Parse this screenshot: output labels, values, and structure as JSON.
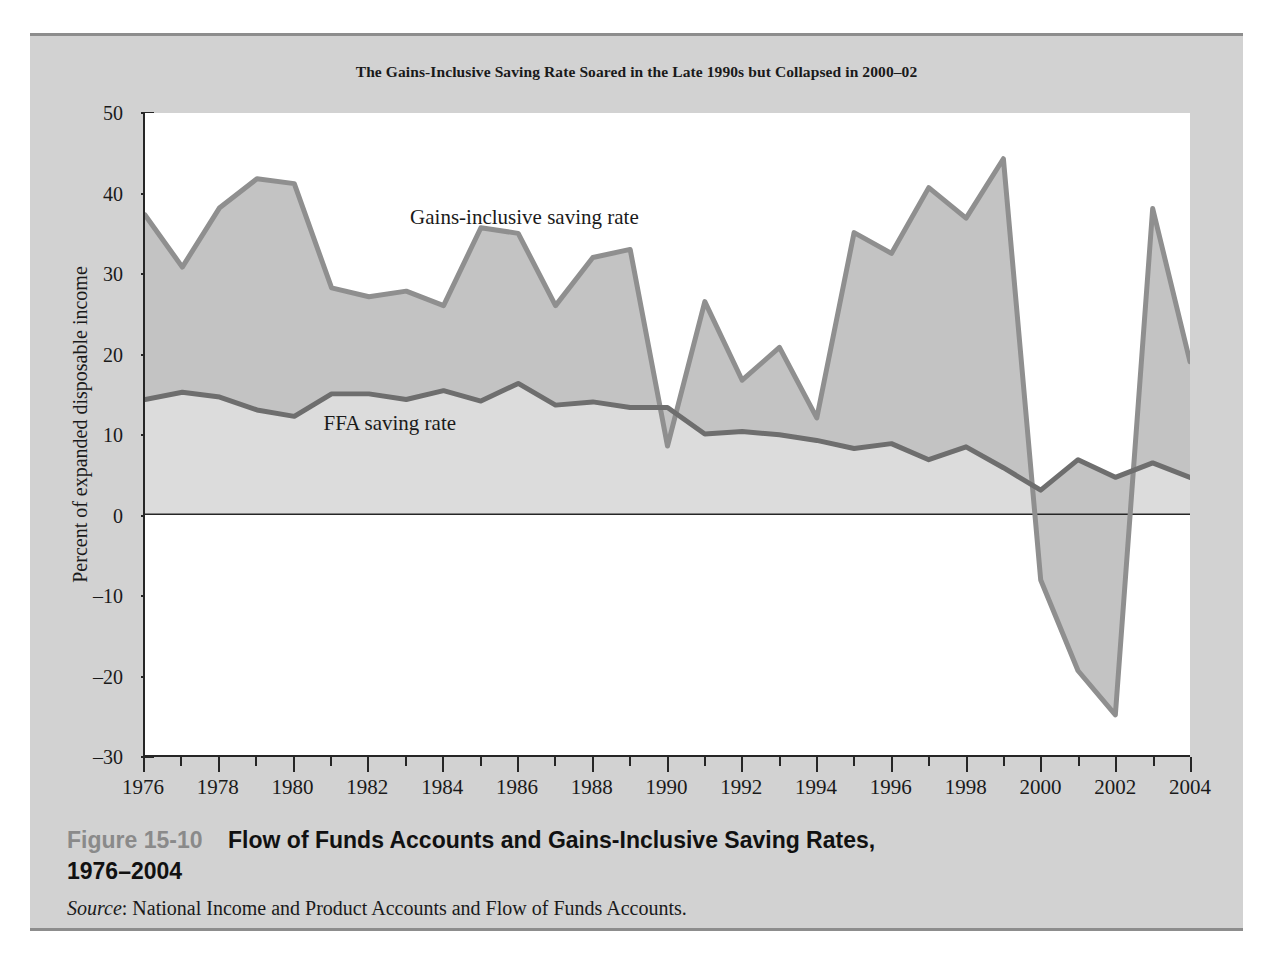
{
  "chart_title": "The Gains-Inclusive Saving Rate Soared in the Late 1990s but Collapsed in 2000–02",
  "y_axis_title": "Percent of expanded disposable income",
  "series_labels": {
    "gains": "Gains-inclusive saving rate",
    "ffa": "FFA saving rate"
  },
  "caption": {
    "figure_number": "Figure 15-10",
    "title_line1": "Flow of Funds Accounts and Gains-Inclusive Saving Rates,",
    "title_line2": "1976–2004",
    "source_word": "Source",
    "source_text": ": National Income and Product Accounts and Flow of Funds Accounts."
  },
  "colors": {
    "figure_background": "#d2d2d2",
    "plot_background": "#ffffff",
    "band_fill": "#c3c3c3",
    "lower_fill": "#dcdcdc",
    "line_gains": "#8f8f8f",
    "line_ffa": "#6e6e6e",
    "axis": "#262626",
    "figure_number": "#8a8a8a",
    "rule": "#8d8d8d"
  },
  "chart_data": {
    "type": "line",
    "title": "The Gains-Inclusive Saving Rate Soared in the Late 1990s but Collapsed in 2000–02",
    "xlabel": "",
    "ylabel": "Percent of expanded disposable income",
    "xlim": [
      1976,
      2004
    ],
    "ylim": [
      -30,
      50
    ],
    "yticks": [
      50,
      40,
      30,
      20,
      10,
      0,
      -10,
      -20,
      -30
    ],
    "ytick_labels": [
      "50",
      "40",
      "30",
      "20",
      "10",
      "0",
      "–10",
      "–20",
      "–30"
    ],
    "xticks": [
      1976,
      1978,
      1980,
      1982,
      1984,
      1986,
      1988,
      1990,
      1992,
      1994,
      1996,
      1998,
      2000,
      2002,
      2004
    ],
    "xtick_labels": [
      "1976",
      "1978",
      "1980",
      "1982",
      "1984",
      "1986",
      "1988",
      "1990",
      "1992",
      "1994",
      "1996",
      "1998",
      "2000",
      "2002",
      "2004"
    ],
    "minor_xticks_every": 1,
    "grid": false,
    "legend": "inline-annotations",
    "zero_line": true,
    "x": [
      1976,
      1977,
      1978,
      1979,
      1980,
      1981,
      1982,
      1983,
      1984,
      1985,
      1986,
      1987,
      1988,
      1989,
      1990,
      1991,
      1992,
      1993,
      1994,
      1995,
      1996,
      1997,
      1998,
      1999,
      2000,
      2001,
      2002,
      2003,
      2004
    ],
    "series": [
      {
        "name": "Gains-inclusive saving rate",
        "values": [
          37.3,
          30.8,
          38.2,
          41.8,
          41.2,
          28.2,
          27.1,
          27.8,
          26.0,
          35.7,
          35.0,
          26.0,
          32.0,
          33.0,
          8.5,
          26.5,
          16.7,
          20.8,
          12.0,
          35.1,
          32.5,
          40.7,
          36.9,
          44.3,
          -8.2,
          -19.5,
          -25.0,
          38.1,
          19.0
        ],
        "fill_to": "FFA saving rate",
        "fill_color": "#c3c3c3"
      },
      {
        "name": "FFA saving rate",
        "values": [
          14.3,
          15.2,
          14.6,
          13.0,
          12.2,
          15.0,
          15.0,
          14.3,
          15.4,
          14.1,
          16.3,
          13.6,
          14.0,
          13.3,
          13.3,
          10.0,
          10.3,
          9.9,
          9.2,
          8.2,
          8.8,
          6.8,
          8.4,
          5.8,
          3.0,
          6.8,
          4.6,
          6.4,
          4.6
        ],
        "fill_to": 0,
        "fill_color": "#dcdcdc"
      }
    ],
    "annotations": [
      {
        "text": "Gains-inclusive saving rate",
        "x": 1986.2,
        "y": 36.8
      },
      {
        "text": "FFA saving rate",
        "x": 1982.6,
        "y": 11.2
      }
    ]
  }
}
